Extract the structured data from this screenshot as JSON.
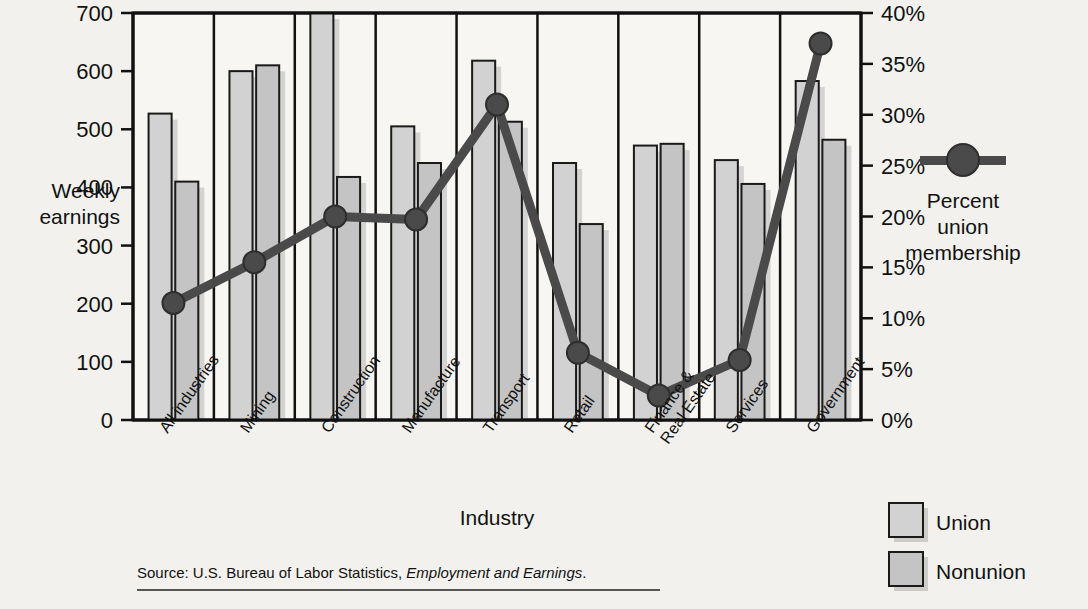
{
  "chart_data": {
    "type": "bar",
    "title": "",
    "categories": [
      "All industries",
      "Mining",
      "Construction",
      "Manufacture",
      "Transport",
      "Retail",
      "Finance &\nReal Estate",
      "Services",
      "Government"
    ],
    "category_labels": [
      {
        "line1": "All industries",
        "line2": ""
      },
      {
        "line1": "Mining",
        "line2": ""
      },
      {
        "line1": "Construction",
        "line2": ""
      },
      {
        "line1": "Manufacture",
        "line2": ""
      },
      {
        "line1": "Transport",
        "line2": ""
      },
      {
        "line1": "Retail",
        "line2": ""
      },
      {
        "line1": "Finance &",
        "line2": "Real Estate"
      },
      {
        "line1": "Services",
        "line2": ""
      },
      {
        "line1": "Government",
        "line2": ""
      }
    ],
    "series": [
      {
        "name": "Union",
        "type": "bar",
        "values": [
          527,
          600,
          700,
          505,
          618,
          442,
          472,
          447,
          583
        ]
      },
      {
        "name": "Nonunion",
        "type": "bar",
        "values": [
          410,
          610,
          418,
          442,
          513,
          337,
          475,
          406,
          482
        ]
      },
      {
        "name": "Percent union membership",
        "type": "line",
        "values": [
          11.5,
          15.5,
          20.0,
          19.7,
          31.0,
          6.6,
          2.4,
          5.9,
          37.0
        ]
      }
    ],
    "xlabel": "Industry",
    "ylabel_left_line1": "Weekly",
    "ylabel_left_line2": "earnings",
    "ylim_left": [
      0,
      700
    ],
    "yticks_left": [
      "0",
      "100",
      "200",
      "300",
      "400",
      "500",
      "600",
      "700"
    ],
    "ylim_right": [
      0,
      40
    ],
    "yticks_right": [
      "0%",
      "5%",
      "10%",
      "15%",
      "20%",
      "25%",
      "30%",
      "35%",
      "40%"
    ],
    "grid": false,
    "legend_position": "right",
    "colors": {
      "union_fill": "#d2d2d2",
      "nonunion_fill": "#c4c4c4",
      "bar_stroke": "#1a1a1a",
      "line_color": "#4a4a4a",
      "background": "#f2f1ee",
      "axis": "#111111"
    }
  },
  "legend": {
    "line_series_label_line1": "Percent",
    "line_series_label_line2": "union",
    "line_series_label_line3": "membership",
    "union_label": "Union",
    "nonunion_label": "Nonunion"
  },
  "footer": {
    "source_prefix": "Source: U.S. Bureau of Labor Statistics, ",
    "source_italic": "Employment and Earnings",
    "source_suffix": "."
  }
}
